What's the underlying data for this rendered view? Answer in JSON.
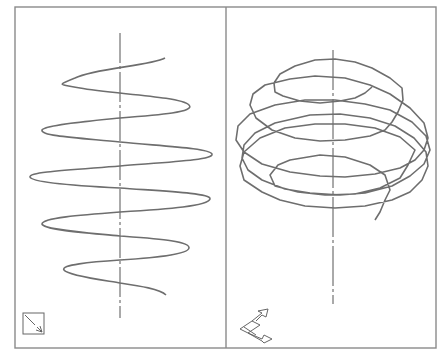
{
  "figure": {
    "viewports": [
      {
        "name": "front-view",
        "ucs_icon": "ucs-broken-pencil-icon"
      },
      {
        "name": "isometric-view",
        "ucs_icon": "ucs-3d-axes-icon"
      }
    ],
    "colors": {
      "line": "#6e6e6e",
      "frame": "#8a8a8a",
      "background": "#ffffff"
    }
  }
}
